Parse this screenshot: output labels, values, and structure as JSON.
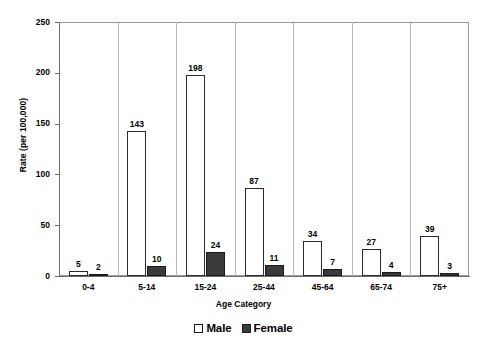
{
  "chart_data": {
    "type": "bar",
    "title": "",
    "xlabel": "Age Category",
    "ylabel": "Rate (per 100,000)",
    "categories": [
      "0-4",
      "5-14",
      "15-24",
      "25-44",
      "45-64",
      "65-74",
      "75+"
    ],
    "series": [
      {
        "name": "Male",
        "values": [
          5,
          143,
          198,
          87,
          34,
          27,
          39
        ]
      },
      {
        "name": "Female",
        "values": [
          2,
          10,
          24,
          11,
          7,
          4,
          3
        ]
      }
    ],
    "ylim": [
      0,
      250
    ],
    "yticks": [
      0,
      50,
      100,
      150,
      200,
      250
    ],
    "ytick_labels": [
      "0",
      "50",
      "100",
      "150",
      "200",
      "250"
    ],
    "grid": false,
    "legend_position": "bottom",
    "data_labels": true,
    "colors": {
      "male_fill": "#ffffff",
      "male_border": "#2b2b2b",
      "female_fill": "#3a3a3a",
      "female_border": "#1a1a1a",
      "axis": "#6e6e6e",
      "frame": "#9a9a9a",
      "text": "#000000"
    }
  },
  "legend": {
    "items": [
      {
        "label": "Male",
        "swatch": "male-swatch-icon"
      },
      {
        "label": "Female",
        "swatch": "female-swatch-icon"
      }
    ]
  }
}
